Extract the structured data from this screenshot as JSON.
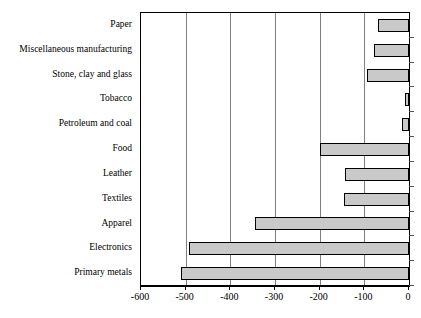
{
  "chart_data": {
    "type": "bar",
    "orientation": "horizontal",
    "title": "",
    "subtitle": "",
    "xlabel": "",
    "ylabel": "",
    "categories": [
      "Paper",
      "Miscellaneous manufacturing",
      "Stone, clay and glass",
      "Tobacco",
      "Petroleum and coal",
      "Food",
      "Leather",
      "Textiles",
      "Apparel",
      "Electronics",
      "Primary metals"
    ],
    "values": [
      -70,
      -78,
      -94,
      -8,
      -15,
      -199,
      -143,
      -145,
      -345,
      -492,
      -510
    ],
    "xlim": [
      -600,
      0
    ],
    "xticks": [
      -600,
      -500,
      -400,
      -300,
      -200,
      -100,
      0
    ],
    "xtick_labels": [
      "-600",
      "-500",
      "-400",
      "-300",
      "-200",
      "-100",
      "0"
    ],
    "grid": true,
    "grid_axis": "x",
    "legend": null,
    "bar_fill_color": "#c9c9c9",
    "bar_edge_color": "#000000",
    "plot_border_color": "#000000",
    "gridline_color": "#808080",
    "background_color": "#ffffff"
  }
}
